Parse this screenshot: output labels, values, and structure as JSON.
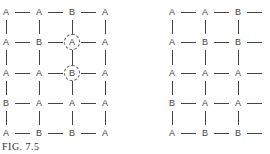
{
  "figure": {
    "caption": "FIG. 7.5",
    "left_grid": {
      "rows": [
        [
          "A",
          "A",
          "B",
          "A"
        ],
        [
          "A",
          "B",
          "A",
          "A"
        ],
        [
          "A",
          "A",
          "B",
          "A"
        ],
        [
          "B",
          "A",
          "A",
          "A"
        ],
        [
          "A",
          "B",
          "B",
          "A"
        ]
      ],
      "circled": [
        [
          1,
          2
        ],
        [
          2,
          2
        ]
      ]
    },
    "right_grid": {
      "rows": [
        [
          "A",
          "A",
          "B"
        ],
        [
          "A",
          "B",
          "B"
        ],
        [
          "A",
          "A",
          "A"
        ],
        [
          "B",
          "A",
          "A"
        ],
        [
          "A",
          "B",
          "B"
        ]
      ],
      "trailing_edges": true
    }
  }
}
